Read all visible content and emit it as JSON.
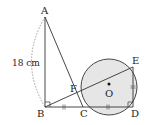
{
  "diagram": {
    "points": {
      "A": "A",
      "B": "B",
      "C": "C",
      "D": "D",
      "E": "E",
      "F": "F",
      "O": "O"
    },
    "measurements": {
      "AB": "18 cm"
    },
    "segments": [
      "AB",
      "BC",
      "CD",
      "AC",
      "BE",
      "ED"
    ],
    "equal_marks": {
      "double_tick": [
        "BC",
        "CD",
        "ED"
      ]
    },
    "right_angles": [
      "ABC",
      "CDE"
    ],
    "circle": {
      "center": "O",
      "fill": "#e6e6e6",
      "stroke": "#333333"
    }
  }
}
